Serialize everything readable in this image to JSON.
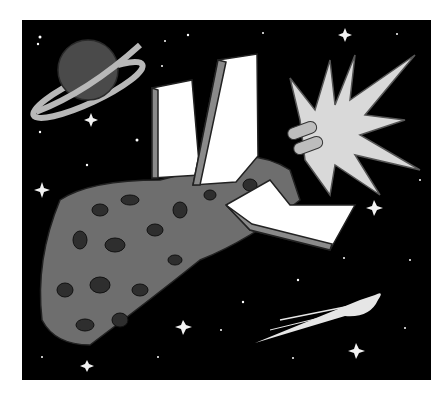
{
  "illustration": {
    "subject": "Rocket ship crashing into an asteroid in outer space",
    "elements": [
      "ringed-planet",
      "rocket-fins",
      "asteroid",
      "explosion-burst",
      "comet",
      "stars"
    ],
    "colors": {
      "page_background": "#ffffff",
      "space": "#000000",
      "planet": "#4a4a4a",
      "planet_ring": "#b8b8b8",
      "fin_face": "#ffffff",
      "fin_edge": "#8a8a8a",
      "asteroid": "#6e6e6e",
      "asteroid_crater": "#2e2e2e",
      "explosion": "#d9d9d9",
      "comet": "#e6e6e6",
      "star": "#ffffff"
    }
  }
}
